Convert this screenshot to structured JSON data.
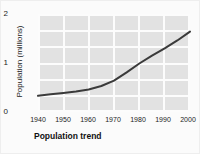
{
  "chart_data": {
    "type": "line",
    "title": "",
    "subtitle": "",
    "xlabel": "Population trend",
    "ylabel": "Population (millions)",
    "xlim": [
      1940,
      2000
    ],
    "ylim": [
      0,
      2
    ],
    "grid": true,
    "legend": false,
    "legend_position": "none",
    "xticks": [
      1940,
      1950,
      1960,
      1970,
      1980,
      1990,
      2000
    ],
    "xtick_labels": [
      "1940",
      "1950",
      "1960",
      "1970",
      "1980",
      "1990",
      "2000"
    ],
    "yticks": [
      0,
      1,
      2
    ],
    "ytick_labels": [
      "0",
      "1",
      "2"
    ],
    "x": [
      1940,
      1945,
      1950,
      1955,
      1960,
      1965,
      1970,
      1975,
      1980,
      1985,
      1990,
      1995,
      2000
    ],
    "values": [
      0.33,
      0.36,
      0.39,
      0.42,
      0.46,
      0.53,
      0.64,
      0.81,
      0.99,
      1.15,
      1.3,
      1.46,
      1.64
    ],
    "series": [
      {
        "name": "Population",
        "color": "#3a3a3a",
        "values": [
          0.33,
          0.36,
          0.39,
          0.42,
          0.46,
          0.53,
          0.64,
          0.81,
          0.99,
          1.15,
          1.3,
          1.46,
          1.64
        ]
      }
    ],
    "plot_background": "#e2e2e2",
    "gridline_color": "#fcfcfc",
    "line_color": "#3a3a3a",
    "figure_background": "#fbfbfb"
  }
}
